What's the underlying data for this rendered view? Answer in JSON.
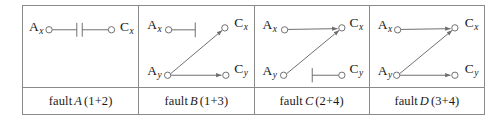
{
  "figure": {
    "name": "fault-diagram-grid",
    "stroke_color": "#6e6e6e",
    "border_color": "#8a8a8a",
    "text_color": "#1a1a1a",
    "background": "#ffffff",
    "node_labels": {
      "ax_main": "A",
      "ax_sub": "x",
      "ay_main": "A",
      "ay_sub": "y",
      "cx_main": "C",
      "cx_sub": "x",
      "cy_main": "C",
      "cy_sub": "y"
    },
    "panels": [
      {
        "id": "panel-a",
        "caption_prefix": "fault",
        "caption_letter": "A",
        "caption_suffix": "(1+2)",
        "nodes": [
          "Ax",
          "Cx"
        ],
        "edges": [
          {
            "from": "Ax",
            "to": "Cx",
            "type": "capacitor-link",
            "arrow": false
          }
        ]
      },
      {
        "id": "panel-b",
        "caption_prefix": "fault",
        "caption_letter": "B",
        "caption_suffix": "(1+3)",
        "nodes": [
          "Ax",
          "Ay",
          "Cx",
          "Cy"
        ],
        "edges": [
          {
            "from": "Ax",
            "to": "stub-right",
            "type": "stub",
            "arrow": false
          },
          {
            "from": "Ay",
            "to": "Cx",
            "type": "diagonal",
            "arrow": true
          },
          {
            "from": "Ay",
            "to": "Cy",
            "type": "horizontal",
            "arrow": true
          }
        ]
      },
      {
        "id": "panel-c",
        "caption_prefix": "fault",
        "caption_letter": "C",
        "caption_suffix": "(2+4)",
        "nodes": [
          "Ax",
          "Ay",
          "Cx",
          "Cy"
        ],
        "edges": [
          {
            "from": "Ax",
            "to": "Cx",
            "type": "horizontal",
            "arrow": true
          },
          {
            "from": "Ay",
            "to": "Cx",
            "type": "diagonal",
            "arrow": true
          },
          {
            "from": "stub-left",
            "to": "Cy",
            "type": "stub",
            "arrow": false
          }
        ]
      },
      {
        "id": "panel-d",
        "caption_prefix": "fault",
        "caption_letter": "D",
        "caption_suffix": "(3+4)",
        "nodes": [
          "Ax",
          "Ay",
          "Cx",
          "Cy"
        ],
        "edges": [
          {
            "from": "Ax",
            "to": "Cx",
            "type": "horizontal",
            "arrow": true
          },
          {
            "from": "Ay",
            "to": "Cx",
            "type": "diagonal",
            "arrow": true
          },
          {
            "from": "Ay",
            "to": "Cy",
            "type": "horizontal",
            "arrow": true
          }
        ]
      }
    ]
  }
}
